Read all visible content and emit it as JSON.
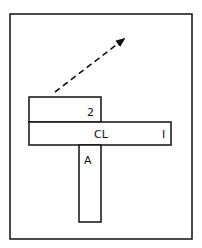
{
  "diagram": {
    "labels": {
      "box_top": "2",
      "bar_center": "CL",
      "bar_right": "I",
      "stem": "A"
    },
    "arrow": {
      "style": "dashed",
      "direction": "up-right"
    },
    "colors": {
      "stroke": "#111111",
      "background": "#ffffff"
    }
  }
}
